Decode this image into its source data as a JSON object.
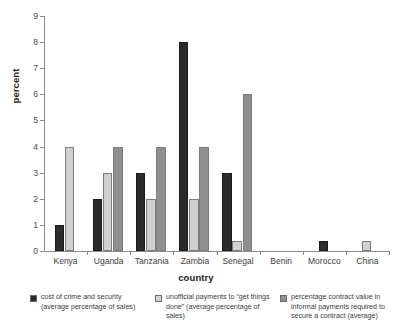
{
  "chart_data": {
    "type": "bar",
    "title": "",
    "subtitle": "",
    "xlabel": "country",
    "ylabel": "percent",
    "ylim": [
      0,
      9
    ],
    "yticks": [
      0,
      1,
      2,
      3,
      4,
      5,
      6,
      7,
      8,
      9
    ],
    "ytick_labels": [
      "0",
      "1",
      "2",
      "3",
      "4",
      "5",
      "6",
      "7",
      "8",
      "9"
    ],
    "grid": false,
    "legend_position": "bottom",
    "categories": [
      "Kenya",
      "Uganda",
      "Tanzania",
      "Zambia",
      "Senegal",
      "Benin",
      "Morocco",
      "China"
    ],
    "series": [
      {
        "name": "cost of crime and security (average percentage of sales)",
        "color": "#2b2b2b",
        "values": [
          1,
          2,
          3,
          8,
          3,
          0,
          0.4,
          0
        ]
      },
      {
        "name": "unofficial payments to “get things done” (average percentage of sales)",
        "color": "#d0d0d0",
        "values": [
          4,
          3,
          2,
          2,
          0.4,
          0,
          0,
          0.4
        ]
      },
      {
        "name": "percentage contract value in informal payments required to secure a contract (average)",
        "color": "#8f8f8f",
        "values": [
          null,
          4,
          4,
          4,
          6,
          0,
          0,
          0
        ]
      }
    ]
  },
  "legend": {
    "items": [
      {
        "swatch_color": "#2b2b2b",
        "line1": "cost of crime and security",
        "line2": "(average percentage of sales)",
        "line3": ""
      },
      {
        "swatch_color": "#d0d0d0",
        "line1": "unofficial payments to “get things",
        "line2": "done” (average percentage of sales)",
        "line3": ""
      },
      {
        "swatch_color": "#8f8f8f",
        "line1": "percentage contract value in",
        "line2": "informal payments required to",
        "line3": "secure a contract (average)"
      }
    ]
  },
  "axes": {
    "y_axis_color": "#8c8c8c",
    "x_axis_color": "#8c8c8c"
  }
}
